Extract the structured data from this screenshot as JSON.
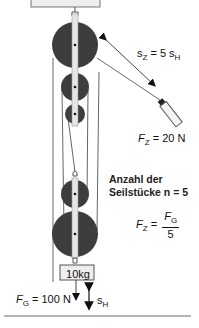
{
  "diagram": {
    "type": "block-and-tackle pulley system",
    "colors": {
      "pulley_fill": "#3d3d3d",
      "frame_fill": "#e6e6e6",
      "rope": "#555555",
      "text": "#111111",
      "ceiling_fill": "#eeeeee"
    },
    "labels": {
      "distance_pull": {
        "var": "s",
        "sub": "Z",
        "eq": " = 5 ",
        "var2": "s",
        "sub2": "H"
      },
      "pull_force": {
        "var": "F",
        "sub": "Z",
        "value": " = 20 N"
      },
      "rope_count_line1": "Anzahl der",
      "rope_count_line2": "Seilstücke n = 5",
      "formula": {
        "lhs_var": "F",
        "lhs_sub": "Z",
        "eq": " = ",
        "num_var": "F",
        "num_sub": "G",
        "den": "5"
      },
      "mass": "10kg",
      "weight_force": {
        "var": "F",
        "sub": "G",
        "value": " = 100 N"
      },
      "lift_distance": {
        "var": "s",
        "sub": "H"
      }
    },
    "components": {
      "fixed_block_pulleys": 3,
      "moving_block_pulleys": 2,
      "rope_segments": 5
    }
  }
}
